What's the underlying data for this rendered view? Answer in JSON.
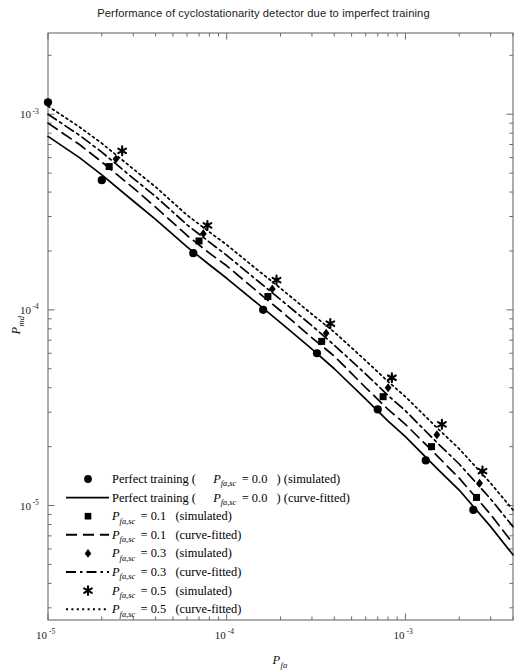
{
  "title": "Performance of cyclostationarity detector due to imperfect training",
  "axes": {
    "x": {
      "label_main": "P",
      "label_sub": "fa",
      "ticks": [
        {
          "mantissa": "10",
          "exponent": "-5",
          "value": 1e-05
        },
        {
          "mantissa": "10",
          "exponent": "-4",
          "value": 0.0001
        },
        {
          "mantissa": "10",
          "exponent": "-3",
          "value": 0.001
        }
      ],
      "scale": "log",
      "range": [
        1e-05,
        0.004
      ]
    },
    "y": {
      "label_main": "P",
      "label_sub": "md",
      "ticks": [
        {
          "mantissa": "10",
          "exponent": "-3",
          "value": 0.001
        },
        {
          "mantissa": "10",
          "exponent": "-4",
          "value": 0.0001
        },
        {
          "mantissa": "10",
          "exponent": "-5",
          "value": 1e-05
        }
      ],
      "scale": "log",
      "range": [
        2.6e-06,
        0.0026
      ]
    }
  },
  "legend": {
    "items": [
      {
        "symbol": "circle-marker",
        "kind": "marker",
        "prefix": "Perfect training (",
        "math_main": "P",
        "math_sub": "fa,sc",
        "eq": " = 0.0",
        "suffix": ") (simulated)"
      },
      {
        "symbol": "solid-line",
        "kind": "line",
        "prefix": "Perfect training (",
        "math_main": "P",
        "math_sub": "fa,sc",
        "eq": " = 0.0",
        "suffix": ") (curve-fitted)"
      },
      {
        "symbol": "square-marker",
        "kind": "marker",
        "prefix": "",
        "math_main": "P",
        "math_sub": "fa,sc",
        "eq": " = 0.1",
        "suffix": " (simulated)"
      },
      {
        "symbol": "dashed-line",
        "kind": "line",
        "prefix": "",
        "math_main": "P",
        "math_sub": "fa,sc",
        "eq": " = 0.1",
        "suffix": " (curve-fitted)"
      },
      {
        "symbol": "diamond-marker",
        "kind": "marker",
        "prefix": "",
        "math_main": "P",
        "math_sub": "fa,sc",
        "eq": " = 0.3",
        "suffix": " (simulated)"
      },
      {
        "symbol": "dashdot-line",
        "kind": "line",
        "prefix": "",
        "math_main": "P",
        "math_sub": "fa,sc",
        "eq": " = 0.3",
        "suffix": " (curve-fitted)"
      },
      {
        "symbol": "star-marker",
        "kind": "marker",
        "prefix": "",
        "math_main": "P",
        "math_sub": "fa,sc",
        "eq": " = 0.5",
        "suffix": " (simulated)"
      },
      {
        "symbol": "dotted-line",
        "kind": "line",
        "prefix": "",
        "math_main": "P",
        "math_sub": "fa,sc",
        "eq": " = 0.5",
        "suffix": " (curve-fitted)"
      }
    ]
  },
  "colors": {
    "line": "#000000",
    "axis": "#6b6b6b",
    "text": "#111111",
    "background": "#ffffff"
  },
  "chart_data": {
    "type": "line",
    "title": "Performance of cyclostationarity detector due to imperfect training",
    "xlabel": "P_fa",
    "ylabel": "P_md",
    "xscale": "log",
    "yscale": "log",
    "xlim": [
      1e-05,
      0.004
    ],
    "ylim": [
      2.6e-06,
      0.0026
    ],
    "grid": false,
    "legend_position": "lower-left-inside",
    "series": [
      {
        "name": "Perfect training (P_fa,sc = 0.0) (curve-fitted)",
        "style": "solid",
        "marker": "none",
        "x": [
          1e-05,
          1.5e-05,
          2e-05,
          3e-05,
          4e-05,
          6e-05,
          8e-05,
          0.0001,
          0.00015,
          0.0002,
          0.0003,
          0.0004,
          0.0006,
          0.0008,
          0.001,
          0.0015,
          0.002,
          0.003,
          0.004
        ],
        "y": [
          0.00077,
          0.0006,
          0.00049,
          0.00036,
          0.00029,
          0.00021,
          0.00017,
          0.000145,
          0.000107,
          8.6e-05,
          6.3e-05,
          5e-05,
          3.5e-05,
          2.7e-05,
          2.25e-05,
          1.55e-05,
          1.2e-05,
          7.8e-06,
          5.6e-06
        ]
      },
      {
        "name": "Perfect training (P_fa,sc = 0.0) (simulated)",
        "style": "markers",
        "marker": "circle",
        "x": [
          1e-05,
          2e-05,
          6.5e-05,
          0.00016,
          0.00032,
          0.0007,
          0.0013,
          0.0024
        ],
        "y": [
          0.00115,
          0.00046,
          0.000195,
          0.0001,
          6e-05,
          3.1e-05,
          1.7e-05,
          9.5e-06
        ]
      },
      {
        "name": "P_fa,sc = 0.1 (curve-fitted)",
        "style": "dashed",
        "marker": "none",
        "x": [
          1e-05,
          1.5e-05,
          2e-05,
          3e-05,
          4e-05,
          6e-05,
          8e-05,
          0.0001,
          0.00015,
          0.0002,
          0.0003,
          0.0004,
          0.0006,
          0.0008,
          0.001,
          0.0015,
          0.002,
          0.003,
          0.004
        ],
        "y": [
          0.0009,
          0.0007,
          0.00057,
          0.00042,
          0.000335,
          0.00024,
          0.000195,
          0.000168,
          0.000123,
          9.9e-05,
          7.2e-05,
          5.8e-05,
          4e-05,
          3.1e-05,
          2.6e-05,
          1.8e-05,
          1.38e-05,
          9e-06,
          6.4e-06
        ]
      },
      {
        "name": "P_fa,sc = 0.1 (simulated)",
        "style": "markers",
        "marker": "square",
        "x": [
          2.2e-05,
          7e-05,
          0.00017,
          0.00034,
          0.00075,
          0.0014,
          0.0025
        ],
        "y": [
          0.00054,
          0.000225,
          0.000117,
          6.9e-05,
          3.6e-05,
          2e-05,
          1.1e-05
        ]
      },
      {
        "name": "P_fa,sc = 0.3 (curve-fitted)",
        "style": "dashdot",
        "marker": "none",
        "x": [
          1e-05,
          1.5e-05,
          2e-05,
          3e-05,
          4e-05,
          6e-05,
          8e-05,
          0.0001,
          0.00015,
          0.0002,
          0.0003,
          0.0004,
          0.0006,
          0.0008,
          0.001,
          0.0015,
          0.002,
          0.003,
          0.004
        ],
        "y": [
          0.001,
          0.00078,
          0.00064,
          0.00047,
          0.00038,
          0.000272,
          0.000222,
          0.00019,
          0.00014,
          0.000113,
          8.3e-05,
          6.6e-05,
          4.7e-05,
          3.65e-05,
          3.05e-05,
          2.1e-05,
          1.63e-05,
          1.08e-05,
          7.8e-06
        ]
      },
      {
        "name": "P_fa,sc = 0.3 (simulated)",
        "style": "markers",
        "marker": "diamond",
        "x": [
          2.4e-05,
          7.4e-05,
          0.00018,
          0.00036,
          0.0008,
          0.0015,
          0.0026
        ],
        "y": [
          0.00059,
          0.000245,
          0.000128,
          7.6e-05,
          4e-05,
          2.3e-05,
          1.3e-05
        ]
      },
      {
        "name": "P_fa,sc = 0.5 (curve-fitted)",
        "style": "dotted",
        "marker": "none",
        "x": [
          1e-05,
          1.5e-05,
          2e-05,
          3e-05,
          4e-05,
          6e-05,
          8e-05,
          0.0001,
          0.00015,
          0.0002,
          0.0003,
          0.0004,
          0.0006,
          0.0008,
          0.001,
          0.0015,
          0.002,
          0.003,
          0.004
        ],
        "y": [
          0.0011,
          0.00086,
          0.00071,
          0.000525,
          0.000425,
          0.000305,
          0.00025,
          0.000215,
          0.000159,
          0.000129,
          9.5e-05,
          7.7e-05,
          5.5e-05,
          4.3e-05,
          3.6e-05,
          2.5e-05,
          1.95e-05,
          1.3e-05,
          9.5e-06
        ]
      },
      {
        "name": "P_fa,sc = 0.5 (simulated)",
        "style": "markers",
        "marker": "star",
        "x": [
          2.6e-05,
          7.8e-05,
          0.00019,
          0.00038,
          0.00084,
          0.0016,
          0.0027
        ],
        "y": [
          0.00065,
          0.00027,
          0.000142,
          8.5e-05,
          4.5e-05,
          2.6e-05,
          1.5e-05
        ]
      }
    ]
  }
}
